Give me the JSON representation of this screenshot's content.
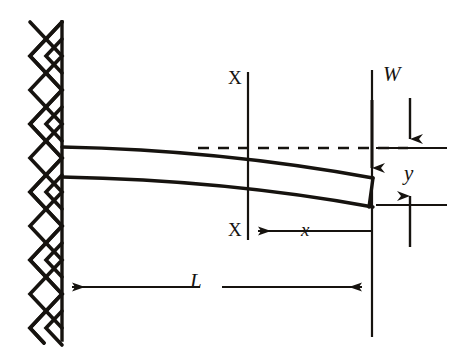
{
  "figure": {
    "type": "engineering-diagram",
    "background_color": "#ffffff",
    "ink_color": "#16130f",
    "labels": {
      "load": "W",
      "section_top": "X",
      "section_bottom": "X",
      "distance_x": "x",
      "deflection_y": "y",
      "length_L": "L"
    },
    "elements": {
      "wall": {
        "name": "fixed-support-wall",
        "hatch_style": "cross-hatch-zigzag",
        "x": 62,
        "y_top": 22,
        "y_bottom": 337
      },
      "beam": {
        "name": "cantilever-beam",
        "root_x": 62,
        "root_top_y": 147,
        "root_bottom_y": 177,
        "tip_x": 373,
        "tip_top_y": 178,
        "tip_bottom_y": 207,
        "thickness": 30,
        "deflection_shape": "cubic-downward"
      },
      "neutral_axis_dashed": {
        "name": "undeflected-axis-dashed-line",
        "x_start": 198,
        "x_end": 408,
        "y": 148,
        "dash": "10 8"
      },
      "section_line": {
        "name": "section-line-x-x",
        "x": 248,
        "y_top": 72,
        "y_bottom": 240
      },
      "load_line": {
        "name": "load-application-line",
        "x": 372,
        "y_top": 70,
        "y_bottom": 337
      },
      "load_arrow": {
        "name": "load-arrow-w",
        "x": 372,
        "y_start": 88,
        "y_end": 178,
        "direction": "down"
      },
      "deflection_indicator_arrow": {
        "name": "deflection-reference-arrow",
        "x": 410,
        "y_start": 98,
        "y_end": 148,
        "direction": "down"
      },
      "dimension_x": {
        "name": "dimension-x",
        "x_left": 248,
        "x_right": 372,
        "y": 231,
        "arrow": "left"
      },
      "dimension_y": {
        "name": "dimension-y",
        "x": 410,
        "y_top": 148,
        "y_bottom": 205,
        "arrows": "both-outward"
      },
      "dimension_L": {
        "name": "dimension-l",
        "x_left": 62,
        "x_right": 372,
        "y": 287,
        "arrows": "both"
      },
      "extension_line_top_y": {
        "name": "extension-line-upper",
        "x_start": 376,
        "x_end": 446,
        "y": 148
      },
      "extension_line_bottom_y": {
        "name": "extension-line-lower",
        "x_start": 376,
        "x_end": 446,
        "y": 205
      }
    },
    "label_positions": {
      "load": {
        "left": 383,
        "top": 64,
        "size": 21
      },
      "section_top": {
        "left": 228,
        "top": 68,
        "size": 19
      },
      "section_bottom": {
        "left": 228,
        "top": 220,
        "size": 19
      },
      "distance_x": {
        "left": 301,
        "top": 220,
        "size": 19
      },
      "deflection_y": {
        "left": 404,
        "top": 163,
        "size": 21
      },
      "length_L": {
        "left": 190,
        "top": 271,
        "size": 21
      }
    }
  }
}
